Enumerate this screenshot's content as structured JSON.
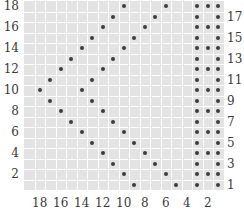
{
  "chart_data": {
    "type": "table",
    "title": "",
    "columns": 19,
    "rows": 18,
    "cell_color": "#e3e3e3",
    "gridline_color": "#ffffff",
    "dot_color": "#3d3d3d",
    "left_row_labels": [
      "18",
      "16",
      "14",
      "12",
      "10",
      "8",
      "6",
      "4",
      "2"
    ],
    "left_row_label_rows": [
      18,
      16,
      14,
      12,
      10,
      8,
      6,
      4,
      2
    ],
    "right_row_labels": [
      "17",
      "15",
      "13",
      "11",
      "9",
      "7",
      "5",
      "3",
      "1"
    ],
    "right_row_label_rows": [
      17,
      15,
      13,
      11,
      9,
      7,
      5,
      3,
      1
    ],
    "bottom_column_labels": [
      "18",
      "16",
      "14",
      "12",
      "10",
      "8",
      "6",
      "4",
      "2"
    ],
    "bottom_column_label_cols": [
      18,
      16,
      14,
      12,
      10,
      8,
      6,
      4,
      2
    ],
    "dots_by_row": {
      "18": [
        10,
        6,
        3,
        2,
        1
      ],
      "17": [
        11,
        7,
        3,
        1
      ],
      "16": [
        12,
        8,
        3,
        2,
        1
      ],
      "15": [
        13,
        9,
        3,
        1
      ],
      "14": [
        14,
        10,
        3,
        2,
        1
      ],
      "13": [
        15,
        11,
        3,
        1
      ],
      "12": [
        16,
        12,
        3,
        2,
        1
      ],
      "11": [
        17,
        13,
        3,
        1
      ],
      "10": [
        18,
        14,
        3,
        2,
        1
      ],
      "9": [
        17,
        13,
        3,
        1
      ],
      "8": [
        16,
        12,
        3,
        2,
        1
      ],
      "7": [
        15,
        11,
        3,
        1
      ],
      "6": [
        14,
        10,
        3,
        2,
        1
      ],
      "5": [
        13,
        9,
        3,
        1
      ],
      "4": [
        12,
        8,
        3,
        2,
        1
      ],
      "3": [
        11,
        7,
        3,
        1
      ],
      "2": [
        10,
        6,
        3,
        2,
        1
      ],
      "1": [
        9,
        5,
        3,
        1
      ]
    }
  }
}
